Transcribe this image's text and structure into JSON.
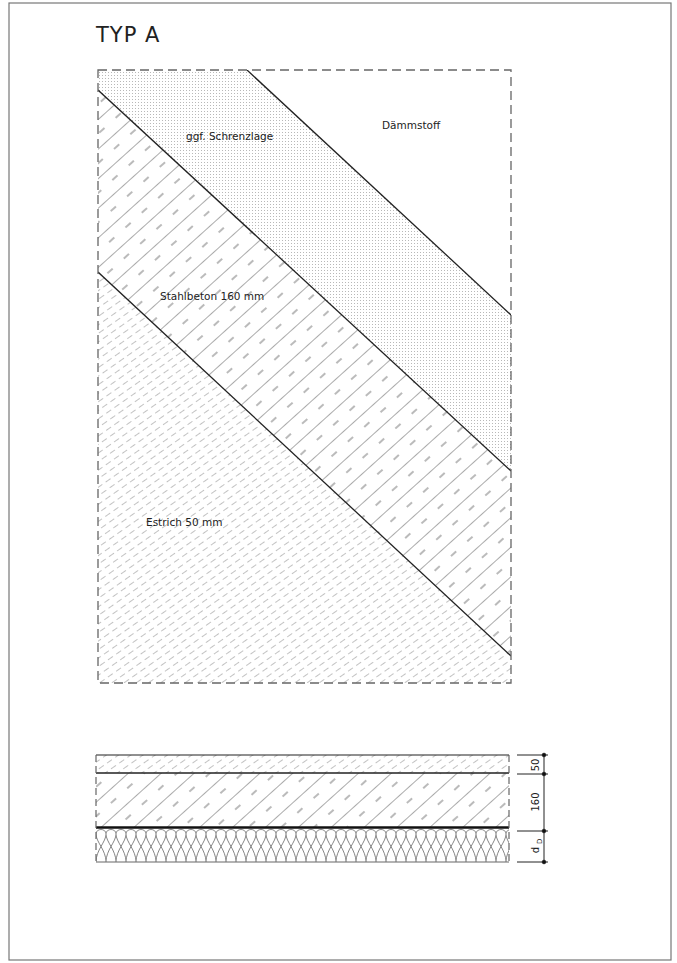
{
  "title": "TYP A",
  "plan": {
    "labels": {
      "daemmstoff": "Dämmstoff",
      "schrenzlage": "ggf. Schrenzlage",
      "stahlbeton": "Stahlbeton 160 mm",
      "estrich": "Estrich 50 mm"
    }
  },
  "section": {
    "dimensions": {
      "estrich": "50",
      "stahlbeton": "160",
      "daemmung": "d",
      "daemmung_sub": "D"
    }
  },
  "colors": {
    "line": "#222222",
    "hatch": "#555555",
    "frame": "#666666",
    "dashed": "#666666",
    "stipple": "#bdbdbd"
  }
}
